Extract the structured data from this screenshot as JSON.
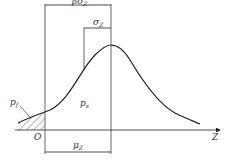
{
  "diagram": {
    "type": "reliability-index-normal-distribution",
    "labels": {
      "beta_sigma": "βσ",
      "beta_sigma_sub": "Z",
      "sigma": "σ",
      "sigma_sub": "Z",
      "mu": "μ",
      "mu_sub": "Z",
      "pf": "p",
      "pf_sub": "f",
      "ps": "p",
      "ps_sub": "s",
      "origin": "O",
      "axis": "Z"
    },
    "colors": {
      "stroke": "#222222",
      "hatch": "#444444"
    }
  }
}
